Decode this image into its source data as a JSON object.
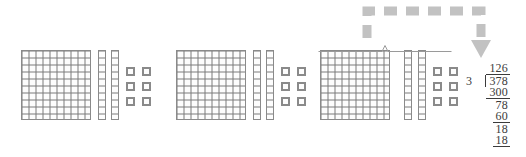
{
  "diagram": {
    "block_groups": [
      {
        "id": "group-1",
        "name": "equal-group-1",
        "hundreds": 1,
        "tens": 2,
        "ones": 6,
        "value": 126
      },
      {
        "id": "group-2",
        "name": "equal-group-2",
        "hundreds": 1,
        "tens": 2,
        "ones": 6,
        "value": 126
      },
      {
        "id": "group-3",
        "name": "equal-group-3",
        "hundreds": 1,
        "tens": 2,
        "ones": 6,
        "value": 126
      }
    ],
    "flat_rows": 10,
    "flat_cols": 10,
    "rod_segments": 10,
    "ones_rows": 3,
    "ones_cols": 2,
    "brace": {
      "name": "group-brace",
      "label": ""
    },
    "arrow": {
      "name": "dashed-arrow",
      "style": "dashed",
      "color": "#c2c2c2",
      "direction": "right-then-down"
    }
  },
  "long_division": {
    "label": "378 divided by 3 equals 126",
    "quotient": "126",
    "divisor": "3",
    "dividend": "378",
    "steps": [
      {
        "name": "partial-product-hundreds",
        "value": "300"
      },
      {
        "name": "remainder-after-hundreds",
        "value": "78"
      },
      {
        "name": "partial-product-tens",
        "value": "60"
      },
      {
        "name": "remainder-after-tens",
        "value": "18"
      },
      {
        "name": "partial-product-ones",
        "value": "18"
      }
    ]
  },
  "colors": {
    "block_outline": "#8a8a8a",
    "grid_line": "#7a7a7a",
    "arrow_gray": "#c2c2c2",
    "text": "#3b3b3b",
    "background": "#ffffff"
  }
}
